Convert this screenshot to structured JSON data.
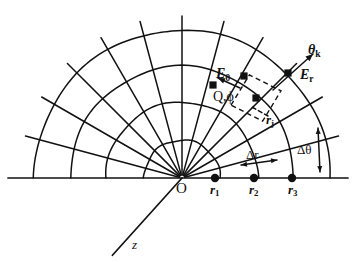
{
  "figure": {
    "type": "spherical-polar-finite-difference-grid",
    "background_color": "#ffffff",
    "ink_color": "#111111"
  },
  "geometry": {
    "origin": {
      "x": 182,
      "y": 178,
      "label": "O"
    },
    "baseline": {
      "x1": 8,
      "y1": 178,
      "x2": 348,
      "y2": 178
    },
    "arc_radii": [
      38,
      76,
      112,
      148
    ],
    "ray_angles_deg": [
      0,
      15,
      30,
      45,
      60,
      75,
      90,
      105,
      120,
      135,
      150,
      165,
      180
    ],
    "ray_overshoot": 14,
    "z_axis": {
      "angle_deg": 228,
      "length": 104
    },
    "node_dots": [
      {
        "name": "r1",
        "x": 215,
        "y": 178
      },
      {
        "name": "r2",
        "x": 254,
        "y": 178
      },
      {
        "name": "r3",
        "x": 292,
        "y": 178
      }
    ],
    "cell": {
      "center": {
        "x": 256,
        "y": 98
      },
      "half_width": 26,
      "half_height": 24,
      "rotation_deg": -16,
      "stroke": "dashed"
    },
    "cell_nodes": [
      {
        "name": "center-node",
        "x": 256,
        "y": 98
      },
      {
        "name": "upper-node",
        "x": 244,
        "y": 76
      },
      {
        "name": "right-node",
        "x": 288,
        "y": 73
      },
      {
        "name": "left-node",
        "x": 213,
        "y": 85
      }
    ]
  },
  "labels": {
    "origin": "O",
    "z_axis": "z",
    "r1": {
      "base": "r",
      "sub": "1"
    },
    "r2": {
      "base": "r",
      "sub": "2"
    },
    "r3": {
      "base": "r",
      "sub": "3"
    },
    "rj": {
      "base": "r",
      "sub": "j"
    },
    "theta_k": {
      "base": "θ",
      "sub": "k"
    },
    "E_theta": {
      "base": "E",
      "sub": "θ"
    },
    "E_r": {
      "base": "E",
      "sub": "r"
    },
    "node_Q": "Q,ϕ",
    "delta_r": "Δr",
    "delta_theta": "Δθ"
  },
  "annotations": {
    "delta_r_arrow": {
      "name": "delta-r-dimension",
      "x1": 241,
      "y1": 165,
      "x2": 277,
      "y2": 160,
      "double_headed": true
    },
    "delta_theta_arrow": {
      "name": "delta-theta-dimension",
      "x1": 318,
      "y1": 128,
      "x2": 320,
      "y2": 172,
      "double_headed": true
    },
    "rj_leader": {
      "name": "rj-leader-line",
      "x1": 268,
      "y1": 116,
      "x2": 250,
      "y2": 106
    },
    "theta_k_arrow": {
      "name": "theta-k-vector",
      "x1": 273,
      "y1": 90,
      "x2": 313,
      "y2": 54
    },
    "E_theta_arrow": {
      "name": "E-theta-vector",
      "x1": 240,
      "y1": 88,
      "x2": 218,
      "y2": 78
    }
  }
}
